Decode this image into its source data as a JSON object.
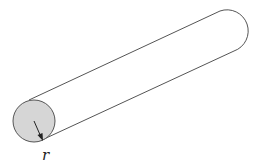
{
  "diagram": {
    "labels": {
      "radius": "r"
    },
    "colors": {
      "outline": "#555555",
      "cross_section_fill": "#d6d6d6",
      "background": "#ffffff",
      "arrow": "#222222"
    }
  }
}
